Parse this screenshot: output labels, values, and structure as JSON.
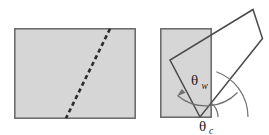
{
  "figure": {
    "background_color": "#ffffff",
    "fill_gray": "#d6d6d6",
    "outline_color": "#6d6d6d",
    "dash_color": "#2b2b2b",
    "arc_color": "#707070",
    "panels": [
      {
        "id": "left-panel",
        "name": "rectangle-with-dashed-line",
        "shapes": [
          {
            "name": "gray-rectangle",
            "type": "rect",
            "x": 14,
            "y": 28,
            "width": 122,
            "height": 91,
            "fill": "#d6d6d6",
            "stroke": "#6d6d6d"
          },
          {
            "name": "dashed-diagonal-line",
            "type": "line",
            "x1": 110,
            "y1": 28,
            "x2": 66,
            "y2": 119,
            "stroke": "#2b2b2b",
            "dash": "4.2 3.2"
          }
        ]
      },
      {
        "id": "right-panel",
        "name": "square-with-rotated-wedge",
        "shapes": [
          {
            "name": "gray-square",
            "type": "rect",
            "x": 160,
            "y": 28,
            "width": 52,
            "height": 89,
            "fill": "#d6d6d6",
            "stroke": "#6d6d6d"
          },
          {
            "name": "white-quadrilateral-wedge",
            "type": "polygon",
            "points": "200,117 170,60 253,9 262,38",
            "fill": "#ffffff",
            "stroke": "#4a4a4a"
          }
        ],
        "angles": [
          {
            "name": "theta-w",
            "symbol": "θ",
            "subscript": "w",
            "label_x": 196,
            "label_y": 80,
            "vertex_x": 200,
            "vertex_y": 117,
            "radius": 44,
            "arrow": true,
            "description": "angle between wedge left edge and horizontal baseline"
          },
          {
            "name": "theta-c",
            "symbol": "θ",
            "subscript": "c",
            "label_x": 206,
            "label_y": 129,
            "vertex_x": 200,
            "vertex_y": 117,
            "radius": 18,
            "arrow": false,
            "description": "angle at the wedge apex measured from horizontal"
          }
        ],
        "outer_arc": {
          "name": "outer-reference-arc",
          "vertex_x": 200,
          "vertex_y": 117,
          "radius": 48
        }
      }
    ]
  }
}
